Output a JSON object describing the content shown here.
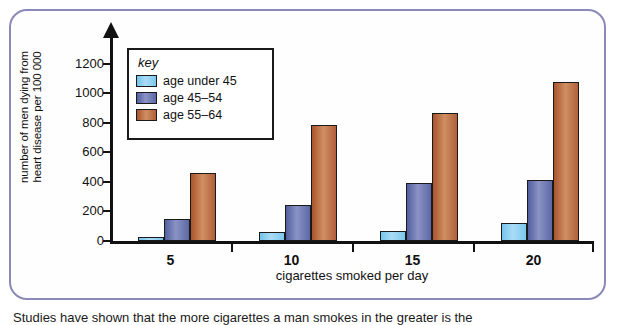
{
  "figure": {
    "border_color": "#8a8ab8",
    "caption_partial": "Studies have shown that the more cigarettes a man smokes in the greater is the"
  },
  "legend": {
    "title": "key",
    "entries": [
      {
        "label": "age under 45",
        "color": "#8ecdee"
      },
      {
        "label": "age 45–54",
        "color": "#6670a8"
      },
      {
        "label": "age 55–64",
        "color": "#b5653a"
      }
    ]
  },
  "chart_data": {
    "type": "bar",
    "title": "",
    "xlabel": "cigarettes smoked per day",
    "ylabel": "number of men dying from heart disease per 100 000",
    "ylabel_lines": [
      "number of men dying from",
      "heart disease per 100 000"
    ],
    "categories": [
      "5",
      "10",
      "15",
      "20"
    ],
    "series": [
      {
        "name": "age under 45",
        "color": "#8ecdee",
        "values": [
          25,
          60,
          65,
          120
        ]
      },
      {
        "name": "age 45–54",
        "color": "#6670a8",
        "values": [
          150,
          245,
          395,
          410
        ]
      },
      {
        "name": "age 55–64",
        "color": "#b5653a",
        "values": [
          460,
          785,
          870,
          1080
        ]
      }
    ],
    "ylim": [
      0,
      1280
    ],
    "yticks": [
      0,
      200,
      400,
      600,
      800,
      1000,
      1200
    ],
    "ytick_labels": [
      "0",
      "200",
      "400",
      "600",
      "800",
      "1000",
      "1200"
    ],
    "grid": false,
    "legend_position": "upper-left-inside",
    "y_axis_has_arrow": true
  }
}
